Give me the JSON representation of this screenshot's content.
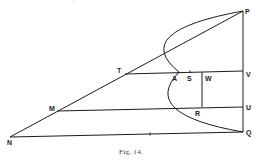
{
  "figure": {
    "caption": "Fig. 14.",
    "top_fragments": [
      "..",
      "-"
    ],
    "points": {
      "P": [
        243,
        11
      ],
      "V": [
        243,
        71
      ],
      "U": [
        243,
        107
      ],
      "Q": [
        243,
        132
      ],
      "N": [
        10,
        137
      ],
      "T": [
        125,
        74
      ],
      "M": [
        57,
        111
      ],
      "A": [
        179,
        72
      ],
      "S": [
        190,
        72
      ],
      "W": [
        202,
        72
      ],
      "R": [
        202,
        107
      ]
    },
    "labels": [
      {
        "text": "P",
        "x": 245,
        "y": 14
      },
      {
        "text": "T",
        "x": 117,
        "y": 73
      },
      {
        "text": "A",
        "x": 172,
        "y": 81
      },
      {
        "text": "S",
        "x": 187,
        "y": 81
      },
      {
        "text": "W",
        "x": 205,
        "y": 81
      },
      {
        "text": "V",
        "x": 246,
        "y": 77
      },
      {
        "text": "M",
        "x": 49,
        "y": 111
      },
      {
        "text": "U",
        "x": 246,
        "y": 110
      },
      {
        "text": "R",
        "x": 195,
        "y": 116
      },
      {
        "text": "Q",
        "x": 246,
        "y": 135
      },
      {
        "text": "N",
        "x": 7,
        "y": 145
      }
    ],
    "segments": [
      [
        "P",
        "N"
      ],
      [
        "P",
        "Q"
      ],
      [
        "N",
        "Q"
      ],
      [
        "T",
        "V"
      ],
      [
        "M",
        "U"
      ],
      [
        "W",
        "R"
      ]
    ],
    "parabola": {
      "from": "P",
      "vertex": "A",
      "to": "Q"
    },
    "tick_mark": [
      150,
      134
    ]
  }
}
